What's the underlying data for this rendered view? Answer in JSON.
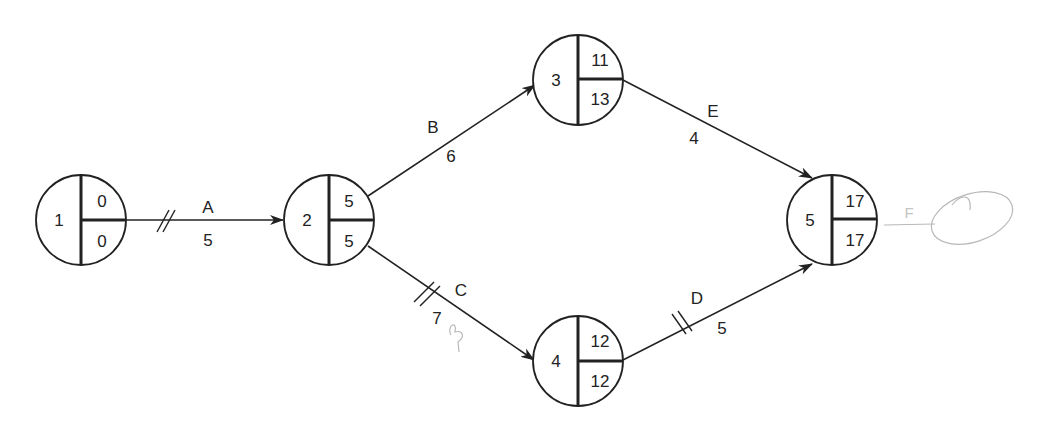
{
  "diagram": {
    "type": "activity-on-arrow network (CPM)",
    "nodes": [
      {
        "id": "1",
        "earliest": "0",
        "latest": "0"
      },
      {
        "id": "2",
        "earliest": "5",
        "latest": "5"
      },
      {
        "id": "3",
        "earliest": "11",
        "latest": "13"
      },
      {
        "id": "4",
        "earliest": "12",
        "latest": "12"
      },
      {
        "id": "5",
        "earliest": "17",
        "latest": "17"
      }
    ],
    "activities": [
      {
        "name": "A",
        "from": "1",
        "to": "2",
        "duration": "5",
        "critical": true
      },
      {
        "name": "B",
        "from": "2",
        "to": "3",
        "duration": "6",
        "critical": false
      },
      {
        "name": "C",
        "from": "2",
        "to": "4",
        "duration": "7",
        "critical": true
      },
      {
        "name": "D",
        "from": "4",
        "to": "5",
        "duration": "5",
        "critical": true
      },
      {
        "name": "E",
        "from": "3",
        "to": "5",
        "duration": "4",
        "critical": false
      }
    ],
    "handwritten_annotation": "F"
  },
  "colors": {
    "line": "#222222",
    "pencil": "#b8b8b8"
  }
}
